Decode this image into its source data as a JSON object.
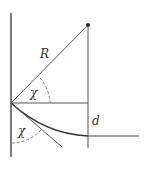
{
  "diagram": {
    "labels": {
      "radius": "R",
      "angle_upper": "χ",
      "angle_lower": "χ",
      "distance": "d"
    },
    "points": {
      "origin": [
        11,
        103
      ],
      "apex": [
        88,
        25
      ]
    },
    "colors": {
      "stroke": "#444444",
      "dashed": "#666666"
    }
  }
}
